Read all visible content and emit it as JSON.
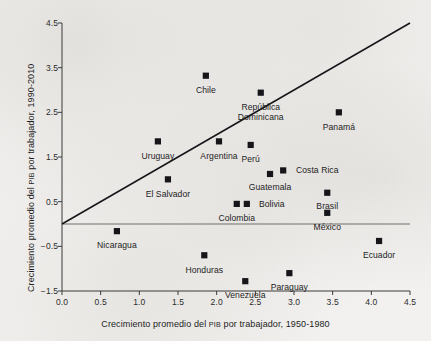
{
  "chart_data": {
    "type": "scatter",
    "title": "",
    "xlabel_parts": [
      "Crecimiento promedio del ",
      "PIB",
      " por trabajador, 1950-1980"
    ],
    "ylabel_parts": [
      "Crecimiento promedio del ",
      "PIB",
      " por trabajador, 1990-2010"
    ],
    "xlabel": "Crecimiento promedio del PIB por trabajador, 1950-1980",
    "ylabel": "Crecimiento promedio del PIB por trabajador, 1990-2010",
    "xlim": [
      0.0,
      4.5
    ],
    "ylim": [
      -1.5,
      4.5
    ],
    "xticks": [
      "0.0",
      "0.5",
      "1.0",
      "1.5",
      "2.0",
      "2.5",
      "3.0",
      "3.5",
      "4.0",
      "4.5"
    ],
    "xtick_values": [
      0.0,
      0.5,
      1.0,
      1.5,
      2.0,
      2.5,
      3.0,
      3.5,
      4.0,
      4.5
    ],
    "yticks": [
      "4.5",
      "3.5",
      "2.5",
      "1.5",
      "0.5",
      "-0.5",
      "-1.5"
    ],
    "ytick_values": [
      4.5,
      3.5,
      2.5,
      1.5,
      0.5,
      -0.5,
      -1.5
    ],
    "grid": false,
    "legend": "none",
    "marker_color": "#16161a",
    "marker_shape": "square",
    "reference_line": {
      "name": "45-degree-line",
      "x0": 0.0,
      "y0": 0.0,
      "x1": 4.5,
      "y1": 4.5,
      "color": "#15151a"
    },
    "zero_line": {
      "y": 0.0,
      "color": "#6e6e6e"
    },
    "points": [
      {
        "label": "Chile",
        "x": 1.86,
        "y": 3.32,
        "lx": 1.86,
        "ly": 3.0,
        "align": "c",
        "lines": [
          "Chile"
        ]
      },
      {
        "label": "República Dominicana",
        "x": 2.57,
        "y": 2.94,
        "lx": 2.57,
        "ly": 2.62,
        "align": "c",
        "lines": [
          "República",
          "Dominicana"
        ]
      },
      {
        "label": "Panamá",
        "x": 3.58,
        "y": 2.5,
        "lx": 3.58,
        "ly": 2.17,
        "align": "c",
        "lines": [
          "Panamá"
        ]
      },
      {
        "label": "Uruguay",
        "x": 1.24,
        "y": 1.85,
        "lx": 1.24,
        "ly": 1.53,
        "align": "c",
        "lines": [
          "Uruguay"
        ]
      },
      {
        "label": "Argentina",
        "x": 2.03,
        "y": 1.85,
        "lx": 2.03,
        "ly": 1.53,
        "align": "c",
        "lines": [
          "Argentina"
        ]
      },
      {
        "label": "Perú",
        "x": 2.44,
        "y": 1.77,
        "lx": 2.44,
        "ly": 1.45,
        "align": "c",
        "lines": [
          "Perú"
        ]
      },
      {
        "label": "Costa Rica",
        "x": 2.86,
        "y": 1.2,
        "lx": 3.0,
        "ly": 1.2,
        "align": "l",
        "lines": [
          "Costa Rica"
        ]
      },
      {
        "label": "Guatemala",
        "x": 2.69,
        "y": 1.12,
        "lx": 2.69,
        "ly": 0.82,
        "align": "c",
        "lines": [
          "Guatemala"
        ]
      },
      {
        "label": "El Salvador",
        "x": 1.37,
        "y": 1.0,
        "lx": 1.37,
        "ly": 0.68,
        "align": "c",
        "lines": [
          "El Salvador"
        ]
      },
      {
        "label": "Brasil",
        "x": 3.43,
        "y": 0.7,
        "lx": 3.43,
        "ly": 0.4,
        "align": "c",
        "lines": [
          "Brasil"
        ]
      },
      {
        "label": "Colombia",
        "x": 2.26,
        "y": 0.45,
        "lx": 2.26,
        "ly": 0.13,
        "align": "c",
        "lines": [
          "Colombia"
        ]
      },
      {
        "label": "Bolivia",
        "x": 2.39,
        "y": 0.45,
        "lx": 2.52,
        "ly": 0.45,
        "align": "l",
        "lines": [
          "Bolivia"
        ]
      },
      {
        "label": "México",
        "x": 3.43,
        "y": 0.25,
        "lx": 3.43,
        "ly": -0.07,
        "align": "c",
        "lines": [
          "México"
        ]
      },
      {
        "label": "Nicaragua",
        "x": 0.71,
        "y": -0.16,
        "lx": 0.71,
        "ly": -0.48,
        "align": "c",
        "lines": [
          "Nicaragua"
        ]
      },
      {
        "label": "Ecuador",
        "x": 4.1,
        "y": -0.38,
        "lx": 4.1,
        "ly": -0.7,
        "align": "c",
        "lines": [
          "Ecuador"
        ]
      },
      {
        "label": "Honduras",
        "x": 1.84,
        "y": -0.7,
        "lx": 1.84,
        "ly": -1.02,
        "align": "c",
        "lines": [
          "Honduras"
        ]
      },
      {
        "label": "Paraguay",
        "x": 2.94,
        "y": -1.1,
        "lx": 2.94,
        "ly": -1.4,
        "align": "c",
        "lines": [
          "Paraguay"
        ]
      },
      {
        "label": "Venezuela",
        "x": 2.37,
        "y": -1.28,
        "lx": 2.37,
        "ly": -1.58,
        "align": "c",
        "lines": [
          "Venezuela"
        ]
      }
    ]
  }
}
